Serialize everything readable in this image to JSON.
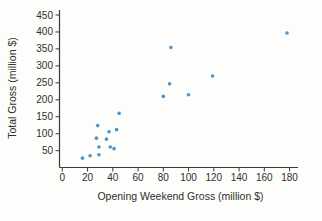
{
  "chart_data": {
    "type": "scatter",
    "title": "",
    "xlabel": "Opening Weekend Gross (million $)",
    "ylabel": "Total Gross (million $)",
    "xlim": [
      0,
      186
    ],
    "ylim": [
      0,
      465
    ],
    "x_ticks": [
      0,
      20,
      40,
      60,
      80,
      100,
      120,
      140,
      160,
      180
    ],
    "y_ticks": [
      50,
      100,
      150,
      200,
      250,
      300,
      350,
      400,
      450
    ],
    "grid": false,
    "legend": false,
    "point_color": "#4f94c6",
    "axis_color": "#3a3a3a",
    "text_color": "#2e2e2e",
    "points": [
      {
        "x": 16,
        "y": 28
      },
      {
        "x": 22,
        "y": 35
      },
      {
        "x": 27,
        "y": 87
      },
      {
        "x": 28,
        "y": 124
      },
      {
        "x": 29,
        "y": 38
      },
      {
        "x": 29,
        "y": 61
      },
      {
        "x": 35,
        "y": 84
      },
      {
        "x": 37,
        "y": 106
      },
      {
        "x": 38,
        "y": 61
      },
      {
        "x": 41,
        "y": 56
      },
      {
        "x": 43,
        "y": 112
      },
      {
        "x": 45,
        "y": 160
      },
      {
        "x": 80,
        "y": 210
      },
      {
        "x": 85,
        "y": 247
      },
      {
        "x": 86,
        "y": 354
      },
      {
        "x": 100,
        "y": 215
      },
      {
        "x": 119,
        "y": 270
      },
      {
        "x": 178,
        "y": 397
      }
    ]
  }
}
